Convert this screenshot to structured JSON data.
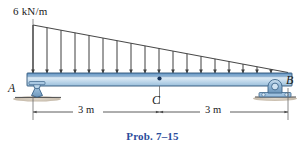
{
  "figure": {
    "caption": "Prob. 7–15",
    "caption_color": "#2b4c9b",
    "type": "beam-free-body-diagram",
    "load": {
      "label": "6 kN/m",
      "shape": "triangular",
      "peak_value": 6,
      "units": "kN/m",
      "peak_at": "A",
      "zero_at": "B",
      "arrow_count": 18,
      "arrow_direction": "down",
      "arrow_color": "#3f3f3f"
    },
    "beam": {
      "label_left": "A",
      "label_right": "B",
      "midpoint_label": "C",
      "fill_top": "#6f9ecb",
      "fill_mid": "#cfe1f0",
      "fill_bottom": "#9cbfdc",
      "outline": "#2d4f72",
      "total_length_m": 6
    },
    "supports": {
      "left": {
        "at": "A",
        "kind": "rocker-support",
        "body_color": "#8fb5d4",
        "ground_color": "#cbbfb0"
      },
      "right": {
        "at": "B",
        "kind": "pin-support",
        "body_color": "#8fb5d4",
        "ground_color": "#cbbfb0"
      }
    },
    "dimensions": [
      {
        "label": "3 m",
        "from": "A",
        "to": "C",
        "value": 3,
        "units": "m"
      },
      {
        "label": "3 m",
        "from": "C",
        "to": "B",
        "value": 3,
        "units": "m"
      }
    ]
  }
}
